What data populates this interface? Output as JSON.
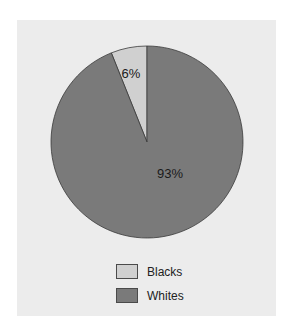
{
  "chart_data": {
    "type": "pie",
    "title": "",
    "categories": [
      "Blacks",
      "Whites"
    ],
    "values": [
      6,
      93
    ],
    "labels": [
      "6%",
      "93%"
    ],
    "colors": [
      "#d0d0d0",
      "#7a7a7a"
    ],
    "start_angle_deg": 0,
    "direction": "counterclockwise",
    "legend_position": "bottom"
  },
  "legend": {
    "items": [
      {
        "label": "Blacks",
        "color": "#d0d0d0"
      },
      {
        "label": "Whites",
        "color": "#7a7a7a"
      }
    ]
  },
  "style": {
    "panel_bg": "#ececec",
    "stroke": "#3a3a3a"
  }
}
